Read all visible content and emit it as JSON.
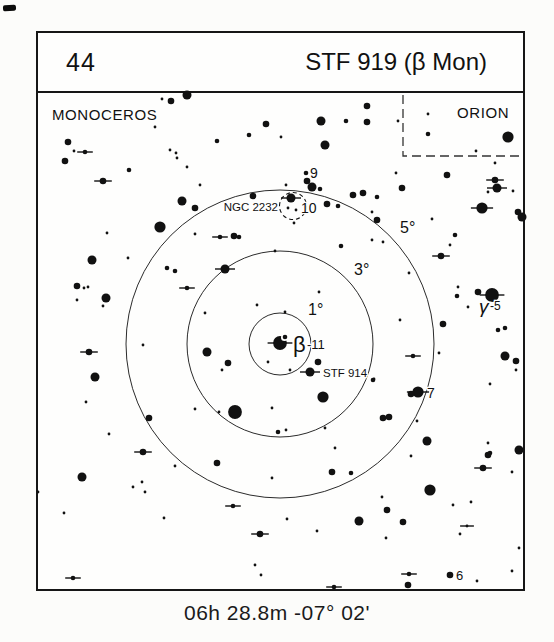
{
  "header": {
    "chart_number": "44",
    "chart_title": "STF 919 (β Mon)"
  },
  "footer": {
    "coordinates": "06h 28.8m  -07° 02'"
  },
  "colors": {
    "ink": "#111111",
    "circle": "#2b2b2b",
    "boundary": "#333333",
    "paper": "#fefefd"
  },
  "chart_data": {
    "type": "scatter",
    "title": "STF 919 (β Mon)",
    "chart_number": "44",
    "caption": "06h 28.8m  -07° 02'",
    "center": {
      "x": 280,
      "y": 344
    },
    "size_radius": {
      "1": 1.4,
      "2": 2.3,
      "3": 3.3,
      "4": 4.5,
      "5": 5.6,
      "6": 6.9
    },
    "degree_circles": [
      {
        "label": "1°",
        "radius": 31,
        "label_x": 308,
        "label_y": 315
      },
      {
        "label": "3°",
        "radius": 93,
        "label_x": 354,
        "label_y": 275
      },
      {
        "label": "5°",
        "radius": 154,
        "label_x": 400,
        "label_y": 233
      }
    ],
    "constellations": [
      {
        "name": "MONOCEROS",
        "x": 52,
        "y": 120
      },
      {
        "name": "ORION",
        "x": 457,
        "y": 118
      }
    ],
    "orion_border": [
      [
        403,
        95
      ],
      [
        403,
        156
      ],
      [
        524,
        156
      ]
    ],
    "ngc2232": {
      "label": "NGC 2232",
      "label_x": 278,
      "label_y": 211,
      "circle": {
        "x": 293,
        "y": 206,
        "r": 13.5
      }
    },
    "beta_companion": {
      "x": 284.5,
      "y": 337.5
    },
    "star_labels": [
      {
        "t": "9",
        "x": 310,
        "y": 178,
        "fs": 14
      },
      {
        "t": "10",
        "x": 301,
        "y": 213,
        "fs": 14
      },
      {
        "t": "7",
        "x": 427,
        "y": 398,
        "fs": 14
      },
      {
        "t": "6",
        "x": 456,
        "y": 580,
        "fs": 13
      },
      {
        "t": "β",
        "x": 293,
        "y": 352,
        "fs": 22
      },
      {
        "t": "-11",
        "x": 307,
        "y": 349,
        "fs": 13
      },
      {
        "t": "γ",
        "x": 479,
        "y": 313,
        "fs": 19,
        "it": 1
      },
      {
        "t": "-5",
        "x": 490,
        "y": 310,
        "fs": 12
      },
      {
        "t": "STF 914",
        "x": 323,
        "y": 377,
        "fs": 11.5
      }
    ],
    "stars": [
      [
        162,
        99,
        1,
        0
      ],
      [
        187,
        95,
        4,
        0
      ],
      [
        171,
        101,
        3,
        0
      ],
      [
        155,
        127,
        1,
        0
      ],
      [
        217,
        141,
        2,
        0
      ],
      [
        249,
        135,
        2,
        0
      ],
      [
        266,
        124,
        3,
        0
      ],
      [
        281,
        137,
        1,
        0
      ],
      [
        321,
        121,
        4,
        0
      ],
      [
        325,
        145,
        4,
        0
      ],
      [
        346,
        121,
        2,
        0
      ],
      [
        367,
        106,
        3,
        0
      ],
      [
        367,
        122,
        3,
        0
      ],
      [
        398,
        121,
        1,
        0
      ],
      [
        428,
        114,
        1,
        0
      ],
      [
        428,
        134,
        2,
        0
      ],
      [
        476,
        151,
        1,
        0
      ],
      [
        508,
        137,
        5,
        0
      ],
      [
        495,
        163,
        1,
        0
      ],
      [
        68,
        142,
        3,
        0
      ],
      [
        74,
        151,
        1,
        0
      ],
      [
        85,
        152,
        2,
        1
      ],
      [
        65,
        161,
        3,
        0
      ],
      [
        170,
        150,
        1,
        0
      ],
      [
        176,
        153,
        1,
        0
      ],
      [
        177,
        158,
        1,
        0
      ],
      [
        187,
        167,
        1,
        0
      ],
      [
        129,
        170,
        2,
        0
      ],
      [
        103,
        181,
        3,
        1
      ],
      [
        200,
        185,
        1,
        0
      ],
      [
        182,
        201,
        4,
        0
      ],
      [
        195,
        208,
        3,
        0
      ],
      [
        396,
        173,
        1,
        0
      ],
      [
        402,
        188,
        3,
        0
      ],
      [
        447,
        175,
        3,
        0
      ],
      [
        495,
        180,
        3,
        1
      ],
      [
        497,
        188,
        4,
        1
      ],
      [
        488,
        192,
        1,
        0
      ],
      [
        513,
        191,
        1,
        0
      ],
      [
        482,
        208,
        5,
        1
      ],
      [
        518,
        212,
        3,
        0
      ],
      [
        522,
        217,
        4,
        0
      ],
      [
        306,
        173,
        2,
        0
      ],
      [
        307,
        181,
        3,
        0
      ],
      [
        312,
        187,
        4,
        0
      ],
      [
        320,
        189,
        2,
        0
      ],
      [
        291,
        198,
        4,
        1
      ],
      [
        288,
        208,
        1,
        0
      ],
      [
        296,
        210,
        1,
        0
      ],
      [
        294,
        223,
        1,
        0
      ],
      [
        327,
        204,
        3,
        0
      ],
      [
        338,
        206,
        2,
        0
      ],
      [
        353,
        195,
        3,
        0
      ],
      [
        363,
        193,
        3,
        0
      ],
      [
        377,
        197,
        2,
        0
      ],
      [
        372,
        212,
        1,
        0
      ],
      [
        377,
        220,
        3,
        0
      ],
      [
        253,
        196,
        3,
        0
      ],
      [
        286,
        185,
        1,
        0
      ],
      [
        432,
        219,
        1,
        0
      ],
      [
        455,
        235,
        2,
        0
      ],
      [
        160,
        227,
        5,
        0
      ],
      [
        195,
        234,
        1,
        0
      ],
      [
        220,
        237,
        2,
        1
      ],
      [
        234,
        236,
        3,
        0
      ],
      [
        239,
        237,
        2,
        0
      ],
      [
        107,
        233,
        1,
        0
      ],
      [
        92,
        260,
        4,
        0
      ],
      [
        128,
        258,
        1,
        0
      ],
      [
        77,
        286,
        3,
        0
      ],
      [
        84,
        288,
        1,
        0
      ],
      [
        88,
        287,
        1,
        0
      ],
      [
        77,
        300,
        1,
        0
      ],
      [
        106,
        298,
        4,
        0
      ],
      [
        103,
        306,
        1,
        0
      ],
      [
        167,
        268,
        2,
        0
      ],
      [
        175,
        271,
        2,
        0
      ],
      [
        187,
        288,
        2,
        1
      ],
      [
        225,
        269,
        4,
        1
      ],
      [
        275,
        251,
        1,
        0
      ],
      [
        341,
        246,
        2,
        0
      ],
      [
        372,
        240,
        1,
        0
      ],
      [
        383,
        242,
        1,
        0
      ],
      [
        450,
        245,
        1,
        0
      ],
      [
        441,
        256,
        3,
        1
      ],
      [
        409,
        273,
        1,
        0
      ],
      [
        458,
        287,
        1,
        0
      ],
      [
        457,
        296,
        2,
        0
      ],
      [
        468,
        307,
        1,
        0
      ],
      [
        478,
        292,
        3,
        0
      ],
      [
        492,
        295,
        6,
        1
      ],
      [
        498,
        330,
        2,
        0
      ],
      [
        505,
        328,
        2,
        0
      ],
      [
        400,
        320,
        1,
        0
      ],
      [
        443,
        324,
        3,
        0
      ],
      [
        319,
        292,
        1,
        0
      ],
      [
        257,
        305,
        1,
        0
      ],
      [
        285,
        312,
        1,
        0
      ],
      [
        205,
        313,
        1,
        0
      ],
      [
        280,
        343,
        6,
        1
      ],
      [
        207,
        352,
        4,
        0
      ],
      [
        143,
        345,
        1,
        0
      ],
      [
        89,
        352,
        3,
        1
      ],
      [
        95,
        377,
        4,
        0
      ],
      [
        228,
        363,
        3,
        0
      ],
      [
        222,
        370,
        1,
        0
      ],
      [
        268,
        362,
        1,
        0
      ],
      [
        290,
        370,
        1,
        0
      ],
      [
        318,
        362,
        3,
        0
      ],
      [
        310,
        372,
        4,
        1
      ],
      [
        373,
        380,
        2,
        0
      ],
      [
        323,
        397,
        5,
        0
      ],
      [
        413,
        356,
        2,
        1
      ],
      [
        439,
        353,
        1,
        0
      ],
      [
        374,
        379,
        1,
        0
      ],
      [
        418,
        392,
        5,
        1
      ],
      [
        411,
        394,
        3,
        0
      ],
      [
        505,
        356,
        4,
        0
      ],
      [
        516,
        361,
        3,
        0
      ],
      [
        516,
        370,
        1,
        0
      ],
      [
        490,
        384,
        1,
        0
      ],
      [
        272,
        408,
        1,
        0
      ],
      [
        235,
        412,
        6,
        0
      ],
      [
        219,
        412,
        1,
        0
      ],
      [
        195,
        409,
        1,
        0
      ],
      [
        86,
        402,
        1,
        0
      ],
      [
        149,
        418,
        3,
        0
      ],
      [
        109,
        434,
        1,
        0
      ],
      [
        143,
        452,
        3,
        1
      ],
      [
        175,
        466,
        1,
        0
      ],
      [
        217,
        463,
        3,
        0
      ],
      [
        383,
        418,
        3,
        0
      ],
      [
        389,
        417,
        3,
        0
      ],
      [
        417,
        421,
        1,
        0
      ],
      [
        427,
        441,
        4,
        0
      ],
      [
        411,
        456,
        1,
        0
      ],
      [
        488,
        443,
        1,
        0
      ],
      [
        488,
        455,
        3,
        0
      ],
      [
        483,
        468,
        3,
        1
      ],
      [
        512,
        472,
        1,
        0
      ],
      [
        519,
        450,
        4,
        0
      ],
      [
        490,
        453,
        2,
        0
      ],
      [
        278,
        432,
        2,
        0
      ],
      [
        286,
        430,
        1,
        0
      ],
      [
        325,
        428,
        1,
        0
      ],
      [
        335,
        448,
        1,
        0
      ],
      [
        272,
        478,
        1,
        0
      ],
      [
        82,
        477,
        4,
        0
      ],
      [
        38,
        492,
        1,
        0
      ],
      [
        133,
        487,
        1,
        0
      ],
      [
        142,
        482,
        1,
        0
      ],
      [
        145,
        492,
        1,
        0
      ],
      [
        332,
        472,
        3,
        0
      ],
      [
        351,
        473,
        2,
        0
      ],
      [
        64,
        513,
        1,
        0
      ],
      [
        164,
        518,
        1,
        0
      ],
      [
        233,
        506,
        2,
        1
      ],
      [
        260,
        534,
        3,
        1
      ],
      [
        255,
        565,
        1,
        0
      ],
      [
        261,
        575,
        1,
        0
      ],
      [
        73,
        578,
        2,
        1
      ],
      [
        287,
        519,
        1,
        0
      ],
      [
        317,
        531,
        1,
        0
      ],
      [
        359,
        521,
        4,
        0
      ],
      [
        387,
        510,
        3,
        0
      ],
      [
        403,
        522,
        3,
        0
      ],
      [
        382,
        497,
        1,
        0
      ],
      [
        386,
        538,
        1,
        0
      ],
      [
        430,
        490,
        5,
        0
      ],
      [
        453,
        505,
        1,
        0
      ],
      [
        471,
        502,
        1,
        0
      ],
      [
        467,
        526,
        1,
        1
      ],
      [
        460,
        534,
        1,
        0
      ],
      [
        477,
        581,
        1,
        0
      ],
      [
        512,
        571,
        1,
        0
      ],
      [
        519,
        548,
        1,
        0
      ],
      [
        409,
        574,
        2,
        1
      ],
      [
        408,
        585,
        3,
        0
      ],
      [
        450,
        575,
        3,
        0
      ],
      [
        334,
        587,
        2,
        1
      ]
    ]
  }
}
